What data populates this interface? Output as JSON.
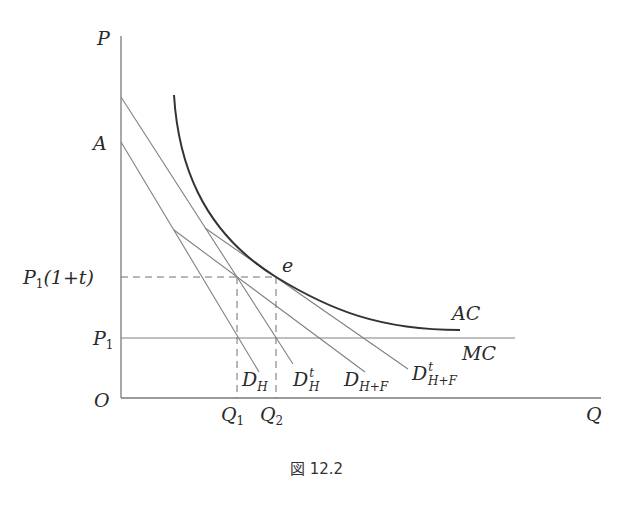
{
  "figure": {
    "caption": "図 12.2",
    "top_cutoff_text": "..."
  },
  "axes": {
    "y_label": "P",
    "x_label": "Q",
    "origin_label": "O"
  },
  "y_ticks": {
    "A": "A",
    "P1_1t_main": "P",
    "P1_1t_sub": "1",
    "P1_1t_rest": "(1+t)",
    "P1_main": "P",
    "P1_sub": "1"
  },
  "x_ticks": {
    "Q1_main": "Q",
    "Q1_sub": "1",
    "Q2_main": "Q",
    "Q2_sub": "2"
  },
  "curves": {
    "AC": "AC",
    "MC": "MC",
    "e": "e",
    "DH_main": "D",
    "DH_sub": "H",
    "DHt_main": "D",
    "DHt_sub": "H",
    "DHt_sup": "t",
    "DHF_main": "D",
    "DHF_sub": "H+F",
    "DHFt_main": "D",
    "DHFt_sub": "H+F",
    "DHFt_sup": "t"
  },
  "colors": {
    "axis": "#7a7a7a",
    "line": "#808080",
    "ac_curve": "#333333",
    "dashed": "#707070"
  }
}
